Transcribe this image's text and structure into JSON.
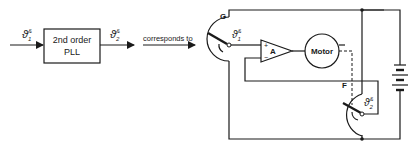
{
  "diagram": {
    "block": {
      "line1": "2nd order",
      "line2": "PLL"
    },
    "input_signal": {
      "base": "ϑ",
      "sup": "&",
      "sub": "1"
    },
    "output_signal": {
      "base": "ϑ",
      "sup": "&",
      "sub": "2"
    },
    "corresponds_label": "corresponds to",
    "generator_label": "G",
    "follower_label": "F",
    "amplifier_label": "A",
    "amp_plus": "+",
    "amp_minus": "−",
    "motor_label": "Motor",
    "pot1_signal": {
      "base": "ϑ",
      "sup": "&",
      "sub": "1"
    },
    "pot2_signal": {
      "base": "ϑ",
      "sup": "&",
      "sub": "2"
    }
  }
}
